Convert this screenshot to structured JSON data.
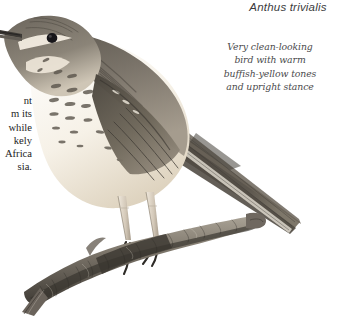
{
  "plate": {
    "width": 342,
    "height": 316,
    "background_color": "#ffffff",
    "subject": "tree-pipit-illustration"
  },
  "title": {
    "species_scientific_name": "Anthus trivialis"
  },
  "annotation": {
    "lines": [
      "Very clean-looking",
      "bird with warm",
      "buffish-yellow tones",
      "and upright stance"
    ]
  },
  "body_text": {
    "clipped": true,
    "lines": [
      "nt",
      "m its",
      "while",
      "kely",
      "Africa",
      "sia."
    ]
  },
  "illustration": {
    "bird": {
      "name": "tree-pipit",
      "pose": "perched upright, facing left",
      "parts": [
        "bill",
        "eye",
        "supercilium",
        "crown",
        "nape",
        "mantle",
        "folded-wing",
        "breast-streaking",
        "flank-streaking",
        "belly",
        "tail",
        "legs",
        "feet-claws"
      ]
    },
    "perch": {
      "name": "branch",
      "description": "mottled lichen-covered branch running lower-left to right"
    },
    "colors": {
      "upperparts": "#6f6a64",
      "upperparts_dark": "#4a4540",
      "underparts": "#f4efe6",
      "buff": "#d8cdb8",
      "streaks": "#4f4a44",
      "bill": "#3a3733",
      "eye": "#17161a",
      "legs": "#cfc3b4",
      "branch": "#8d867c",
      "branch_dark": "#4e4942",
      "outline": "#55514b"
    }
  }
}
